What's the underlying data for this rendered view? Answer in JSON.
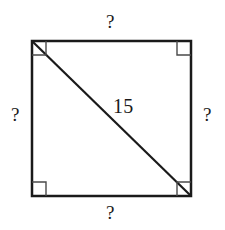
{
  "figure": {
    "type": "geometry-diagram",
    "background_color": "#ffffff",
    "stroke_color": "#1a1a1a",
    "text_color": "#1a1a1a",
    "square": {
      "left": 32,
      "top": 41,
      "right": 191,
      "bottom": 196,
      "side_px": 159,
      "border_width_px": 2.5
    },
    "diagonal": {
      "from": "top-left",
      "to": "bottom-right",
      "x1": 32,
      "y1": 41,
      "x2": 191,
      "y2": 196,
      "width_px": 2,
      "label": "15"
    },
    "right_angle_markers": {
      "size_px": 14,
      "stroke_width_px": 1.4,
      "corners": [
        "top-left",
        "top-right",
        "bottom-left",
        "bottom-right"
      ]
    },
    "labels": {
      "top": "?",
      "right": "?",
      "bottom": "?",
      "left": "?",
      "diagonal": "15"
    }
  }
}
